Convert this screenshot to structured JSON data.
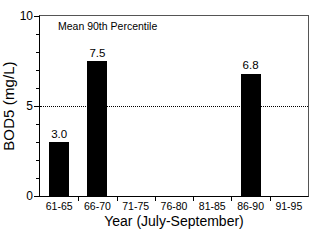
{
  "chart_data": {
    "type": "bar",
    "title": "",
    "annotation": "Mean 90th Percentile",
    "xlabel": "Year (July-September)",
    "ylabel": "BOD5 (mg/L)",
    "categories": [
      "61-65",
      "66-70",
      "71-75",
      "76-80",
      "81-85",
      "86-90",
      "91-95"
    ],
    "values": [
      3.0,
      7.5,
      null,
      null,
      null,
      6.8,
      null
    ],
    "value_labels": [
      "3.0",
      "7.5",
      "",
      "",
      "",
      "6.8",
      ""
    ],
    "ylim": [
      0,
      10
    ],
    "ytick_labels": [
      "0",
      "5",
      "10"
    ],
    "ytick_values": [
      0,
      5,
      10
    ],
    "yminor_values": [
      1,
      2,
      3,
      4,
      6,
      7,
      8,
      9
    ],
    "grid": false,
    "legend": null,
    "reference_line": {
      "value": 5,
      "style": "dotted",
      "color": "#000000"
    },
    "bar_color": "#000000"
  }
}
